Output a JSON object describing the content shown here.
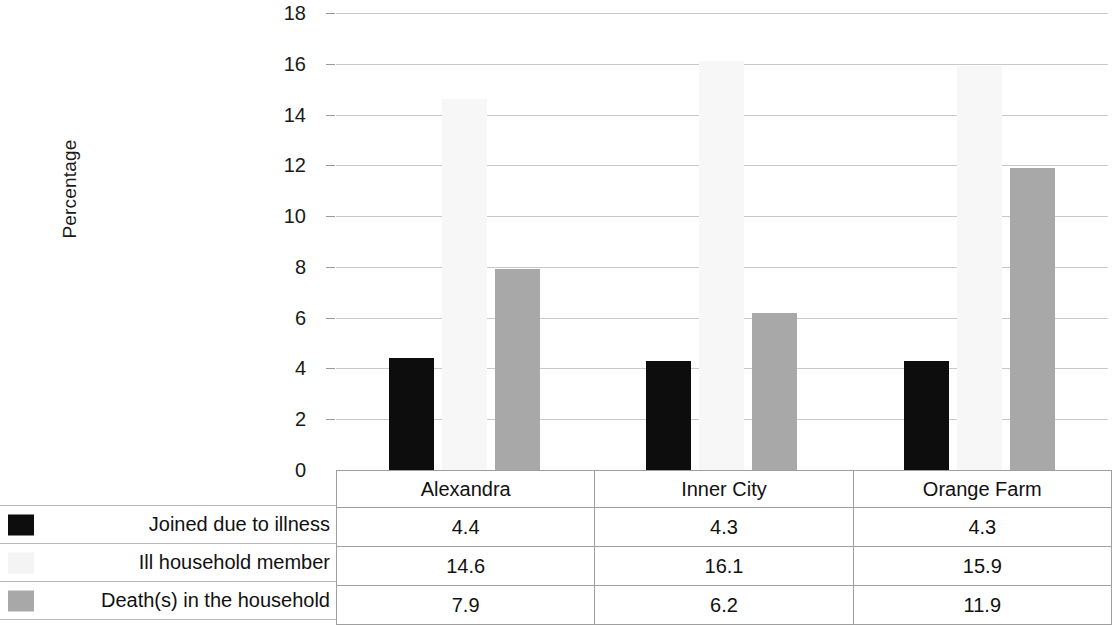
{
  "chart_data": {
    "type": "bar",
    "title": "",
    "subtitle": "",
    "xlabel": "",
    "ylabel": "Percentage",
    "ylim": [
      0,
      18
    ],
    "ytick_step": 2,
    "yticks": [
      "0",
      "2",
      "4",
      "6",
      "8",
      "10",
      "12",
      "14",
      "16",
      "18"
    ],
    "grid": true,
    "legend_position": "table-left",
    "categories": [
      "Alexandra",
      "Inner City",
      "Orange Farm"
    ],
    "series": [
      {
        "name": "Joined due to illness",
        "color": "#0d0d0d",
        "values": [
          4.4,
          4.3,
          4.3
        ]
      },
      {
        "name": "Ill household member",
        "color": "#f4f4f4",
        "values": [
          14.6,
          16.1,
          15.9
        ]
      },
      {
        "name": "Death(s) in the household",
        "color": "#a8a8a8",
        "values": [
          7.9,
          6.2,
          11.9
        ]
      }
    ],
    "data_table": {
      "header": [
        "",
        "Alexandra",
        "Inner City",
        "Orange Farm"
      ],
      "rows": [
        {
          "label": "Joined due to illness",
          "swatch": "black-swatch-icon",
          "cells": [
            "4.4",
            "4.3",
            "4.3"
          ]
        },
        {
          "label": "Ill household member",
          "swatch": "white-swatch-icon",
          "cells": [
            "14.6",
            "16.1",
            "15.9"
          ]
        },
        {
          "label": "Death(s) in the household",
          "swatch": "gray-swatch-icon",
          "cells": [
            "7.9",
            "6.2",
            "11.9"
          ]
        }
      ]
    }
  },
  "colors": {
    "series_1": "#0d0d0d",
    "series_2": "#f4f4f4",
    "series_3": "#a8a8a8",
    "gridline": "#c9c9c9",
    "table_border": "#9f9f9f",
    "background": "#ffffff"
  }
}
